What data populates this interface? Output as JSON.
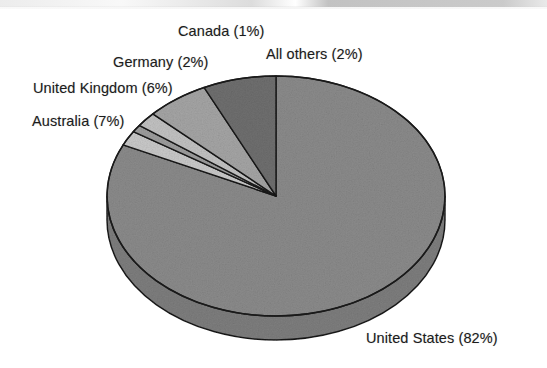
{
  "chart_data": {
    "type": "pie",
    "title": "",
    "subtitle": "",
    "xlabel": "",
    "ylabel": "",
    "legend_position": "none",
    "grid": false,
    "style": "3d-exploded-none",
    "unit": "%",
    "categories": [
      "United States",
      "All others",
      "Canada",
      "Germany",
      "United Kingdom",
      "Australia"
    ],
    "values": [
      82,
      2,
      1,
      2,
      6,
      7
    ],
    "labels": [
      "United States (82%)",
      "All others (2%)",
      "Canada (1%)",
      "Germany (2%)",
      "United Kingdom (6%)",
      "Australia (7%)"
    ],
    "slices": [
      {
        "name": "United States",
        "value": 82,
        "label": "United States (82%)",
        "color": "#8b8b8b",
        "side_color": "#7e7e7e"
      },
      {
        "name": "All others",
        "value": 2,
        "label": "All others (2%)",
        "color": "#c9c9c9",
        "side_color": "#bcbcbc"
      },
      {
        "name": "Canada",
        "value": 1,
        "label": "Canada (1%)",
        "color": "#9d9d9d",
        "side_color": "#919191"
      },
      {
        "name": "Germany",
        "value": 2,
        "label": "Germany (2%)",
        "color": "#c2c2c2",
        "side_color": "#b5b5b5"
      },
      {
        "name": "United Kingdom",
        "value": 6,
        "label": "United Kingdom (6%)",
        "color": "#a5a5a5",
        "side_color": "#989898"
      },
      {
        "name": "Australia",
        "value": 7,
        "label": "Australia (7%)",
        "color": "#6f6f6f",
        "side_color": "#656565"
      }
    ],
    "outline_color": "#1a1a1a",
    "background_color": "#ffffff",
    "text_color": "#1c1c1c"
  },
  "labels": {
    "canada": "Canada (1%)",
    "all_others": "All others (2%)",
    "germany": "Germany (2%)",
    "united_kingdom": "United Kingdom (6%)",
    "australia": "Australia (7%)",
    "united_states": "United States (82%)"
  }
}
